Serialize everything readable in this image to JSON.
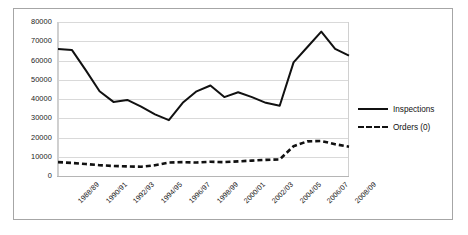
{
  "chart_data": {
    "type": "line",
    "title": "",
    "xlabel": "",
    "ylabel": "",
    "ylim": [
      0,
      80000
    ],
    "ytick_values": [
      80000,
      70000,
      60000,
      50000,
      40000,
      30000,
      20000,
      10000,
      0
    ],
    "ytick_labels": [
      "80000",
      "70000",
      "60000",
      "50000",
      "40000",
      "30000",
      "20000",
      "10000",
      "0"
    ],
    "grid": true,
    "legend_position": "right",
    "categories": [
      "1988/89",
      "1989/90",
      "1990/91",
      "1991/92",
      "1992/93",
      "1993/94",
      "1994/95",
      "1995/96",
      "1996/97",
      "1997/98",
      "1998/99",
      "1999/00",
      "2000/01",
      "2001/02",
      "2002/03",
      "2003/04",
      "2004/05",
      "2005/06",
      "2006/07",
      "2007/08",
      "2008/09",
      "2009/10"
    ],
    "xtick_labels": [
      "1988/89",
      "1990/91",
      "1992/93",
      "1994/95",
      "1996/97",
      "1998/99",
      "2000/01",
      "2002/03",
      "2004/05",
      "2006/07",
      "2008/09"
    ],
    "xtick_indices": [
      0,
      2,
      4,
      6,
      8,
      10,
      12,
      14,
      16,
      18,
      20
    ],
    "series": [
      {
        "name": "Inspections",
        "style": "solid",
        "color": "#111111",
        "values": [
          66000,
          65500,
          55000,
          44000,
          38500,
          39500,
          36000,
          32000,
          29000,
          38000,
          44000,
          47000,
          41000,
          43500,
          41000,
          38000,
          36500,
          59000,
          67000,
          75000,
          66000,
          62500
        ]
      },
      {
        "name": "Orders (0)",
        "style": "dashed",
        "color": "#111111",
        "values": [
          7200,
          6800,
          6200,
          5600,
          5200,
          5000,
          4800,
          5600,
          7000,
          7200,
          7000,
          7400,
          7200,
          7600,
          8000,
          8400,
          8600,
          15500,
          18000,
          18200,
          16500,
          15200
        ]
      }
    ]
  }
}
